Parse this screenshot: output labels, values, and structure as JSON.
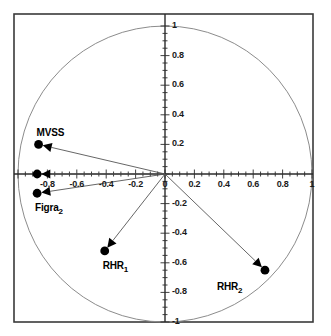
{
  "chart_data": {
    "type": "scatter",
    "title": "",
    "subtitle": "",
    "xlabel": "",
    "ylabel": "",
    "xlim": [
      -1,
      1
    ],
    "ylim": [
      -1,
      1
    ],
    "grid": false,
    "legend": "none",
    "unit_circle": true,
    "xticks": [
      {
        "value": -1,
        "label": "-1",
        "show_label": false
      },
      {
        "value": -0.8,
        "label": "-0.8",
        "show_label": true
      },
      {
        "value": -0.6,
        "label": "-0.6",
        "show_label": true
      },
      {
        "value": -0.4,
        "label": "-0.4",
        "show_label": true
      },
      {
        "value": -0.2,
        "label": "-0.2",
        "show_label": true
      },
      {
        "value": 0,
        "label": "0",
        "show_label": true
      },
      {
        "value": 0.2,
        "label": "0.2",
        "show_label": true
      },
      {
        "value": 0.4,
        "label": "0.4",
        "show_label": true
      },
      {
        "value": 0.6,
        "label": "0.6",
        "show_label": true
      },
      {
        "value": 0.8,
        "label": "0.8",
        "show_label": true
      },
      {
        "value": 1,
        "label": "1",
        "show_label": true
      }
    ],
    "yticks": [
      {
        "value": 1,
        "label": "1",
        "show_label": true
      },
      {
        "value": 0.8,
        "label": "0.8",
        "show_label": true
      },
      {
        "value": 0.6,
        "label": "0.6",
        "show_label": true
      },
      {
        "value": 0.4,
        "label": "0.4",
        "show_label": true
      },
      {
        "value": 0.2,
        "label": "0.2",
        "show_label": true
      },
      {
        "value": 0,
        "label": "0",
        "show_label": true
      },
      {
        "value": -0.2,
        "label": "-0.2",
        "show_label": true
      },
      {
        "value": -0.4,
        "label": "-0.4",
        "show_label": true
      },
      {
        "value": -0.6,
        "label": "-0.6",
        "show_label": true
      },
      {
        "value": -0.8,
        "label": "-0.8",
        "show_label": true
      },
      {
        "value": -1,
        "label": "-1",
        "show_label": true
      }
    ],
    "minor_tick_step": 0.05,
    "points": [
      {
        "name": "MVSS",
        "label": "MVSS",
        "sub": "",
        "x": -0.86,
        "y": 0.2,
        "label_dx": -2,
        "label_dy": -17
      },
      {
        "name": "var-axis",
        "label": "",
        "sub": "",
        "x": -0.87,
        "y": 0.0,
        "label_dx": 0,
        "label_dy": 0
      },
      {
        "name": "Figra2",
        "label": "Figra",
        "sub": "2",
        "x": -0.87,
        "y": -0.13,
        "label_dx": -2,
        "label_dy": 9
      },
      {
        "name": "RHR1",
        "label": "RHR",
        "sub": "1",
        "x": -0.41,
        "y": -0.52,
        "label_dx": -2,
        "label_dy": 9
      },
      {
        "name": "RHR2",
        "label": "RHR",
        "sub": "2",
        "x": 0.68,
        "y": -0.65,
        "label_dx": -48,
        "label_dy": 11
      }
    ],
    "colors": {
      "frame": "#3a3a3a",
      "axis": "#2b2b2b",
      "circle": "#8c8c8c",
      "arrow": "#555555",
      "marker": "#000000",
      "text": "#111111",
      "background": "#ffffff"
    }
  },
  "geometry": {
    "frame_left": 14,
    "frame_top": 14,
    "frame_right": 313,
    "frame_bottom": 322,
    "origin_x": 165,
    "origin_y": 174,
    "scale_x": 147,
    "scale_y": 148
  }
}
